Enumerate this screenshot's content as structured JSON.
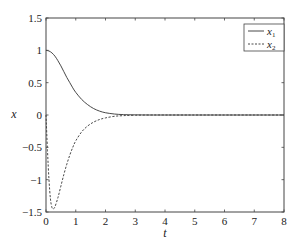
{
  "chart_data": {
    "type": "line",
    "title": "",
    "xlabel": "t",
    "ylabel": "x",
    "xlim": [
      0,
      8
    ],
    "ylim": [
      -1.5,
      1.5
    ],
    "xticks": [
      0,
      1,
      2,
      3,
      4,
      5,
      6,
      7,
      8
    ],
    "yticks": [
      -1.5,
      -1,
      -0.5,
      0,
      0.5,
      1,
      1.5
    ],
    "xtick_labels": [
      "0",
      "1",
      "2",
      "3",
      "4",
      "5",
      "6",
      "7",
      "8"
    ],
    "ytick_labels": [
      "−1.5",
      "−1",
      "−0.5",
      "0",
      "0.5",
      "1",
      "1.5"
    ],
    "grid": false,
    "legend_position": "upper right",
    "series": [
      {
        "name": "x1",
        "label_main": "x",
        "label_sub": "1",
        "style": "solid",
        "color": "#333333",
        "x": [
          0,
          0.1,
          0.2,
          0.3,
          0.4,
          0.5,
          0.6,
          0.7,
          0.8,
          0.9,
          1.0,
          1.2,
          1.4,
          1.6,
          1.8,
          2.0,
          2.3,
          2.6,
          3.0,
          3.5,
          4,
          5,
          6,
          7,
          8
        ],
        "values": [
          1.0,
          0.99,
          0.96,
          0.91,
          0.84,
          0.76,
          0.67,
          0.58,
          0.5,
          0.42,
          0.35,
          0.24,
          0.16,
          0.1,
          0.06,
          0.035,
          0.015,
          0.006,
          0.002,
          0.0,
          0,
          0,
          0,
          0,
          0
        ]
      },
      {
        "name": "x2",
        "label_main": "x",
        "label_sub": "2",
        "style": "dashed",
        "color": "#333333",
        "x": [
          0,
          0.05,
          0.1,
          0.15,
          0.2,
          0.25,
          0.3,
          0.4,
          0.5,
          0.6,
          0.7,
          0.8,
          0.9,
          1.0,
          1.2,
          1.4,
          1.6,
          1.8,
          2.0,
          2.3,
          2.6,
          3.0,
          3.5,
          4,
          5,
          6,
          7,
          8
        ],
        "values": [
          0,
          -0.55,
          -1.0,
          -1.3,
          -1.43,
          -1.45,
          -1.42,
          -1.28,
          -1.1,
          -0.92,
          -0.76,
          -0.62,
          -0.5,
          -0.4,
          -0.26,
          -0.17,
          -0.11,
          -0.07,
          -0.045,
          -0.02,
          -0.01,
          -0.003,
          0,
          0,
          0,
          0,
          0,
          0
        ]
      }
    ]
  },
  "legend": {
    "entries": [
      {
        "main": "x",
        "sub": "1"
      },
      {
        "main": "x",
        "sub": "2"
      }
    ]
  },
  "axes": {
    "xlabel": "t",
    "ylabel": "x"
  }
}
